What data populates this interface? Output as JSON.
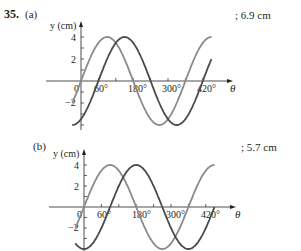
{
  "problem": {
    "number": "35.",
    "parts": [
      {
        "label": "(a)",
        "answer": "; 6.9 cm"
      },
      {
        "label": "(b)",
        "answer": "; 5.7 cm"
      }
    ]
  },
  "colors": {
    "light_curve": "#8a8a8a",
    "dark_curve": "#4a4a4a",
    "axis": "#231f20"
  },
  "chart_data": [
    {
      "type": "line",
      "title": "(a)",
      "xlabel": "θ",
      "ylabel": "y (cm)",
      "xticks": [
        "0",
        "60°",
        "180°",
        "300°",
        "420°"
      ],
      "yticks": [
        "4",
        "2",
        "−2",
        "−4"
      ],
      "xlim": [
        -30,
        450
      ],
      "ylim": [
        -4,
        4
      ],
      "series": [
        {
          "name": "wave 1",
          "color": "#8a8a8a",
          "formula": "4 sin(θ)",
          "phase_deg": 0,
          "amplitude": 4
        },
        {
          "name": "wave 2",
          "color": "#4a4a4a",
          "formula": "4 sin(θ − 60°)",
          "phase_deg": 60,
          "amplitude": 4
        }
      ],
      "annotation": "; 6.9 cm"
    },
    {
      "type": "line",
      "title": "(b)",
      "xlabel": "θ",
      "ylabel": "y (cm)",
      "xticks": [
        "0",
        "60°",
        "180°",
        "300°",
        "420°"
      ],
      "yticks": [
        "4",
        "2",
        "−2",
        "−4"
      ],
      "xlim": [
        -30,
        450
      ],
      "ylim": [
        -4,
        4
      ],
      "series": [
        {
          "name": "wave 1",
          "color": "#8a8a8a",
          "formula": "4 sin(θ)",
          "phase_deg": 0,
          "amplitude": 4
        },
        {
          "name": "wave 2",
          "color": "#4a4a4a",
          "formula": "4 sin(θ − 90°)",
          "phase_deg": 90,
          "amplitude": 4
        }
      ],
      "annotation": "; 5.7 cm"
    }
  ],
  "axis_labels": {
    "y": "y (cm)",
    "x": "θ",
    "zero": "0",
    "t60": "60°",
    "t180": "180°",
    "t300": "300°",
    "t420": "420°",
    "y4": "4",
    "y2": "2",
    "yn2": "−2",
    "yn4": "−4"
  }
}
